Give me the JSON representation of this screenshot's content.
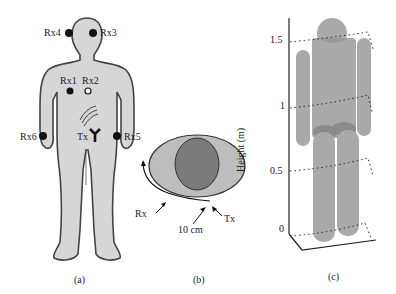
{
  "panel_a": {
    "caption": "(a)",
    "receivers": [
      {
        "label": "Rx4"
      },
      {
        "label": "Rx3"
      },
      {
        "label": "Rx1"
      },
      {
        "label": "Rx2"
      },
      {
        "label": "Rx6"
      },
      {
        "label": "Rx5"
      }
    ],
    "transmitter": {
      "label": "Tx"
    }
  },
  "panel_b": {
    "caption": "(b)",
    "rx_label": "Rx",
    "tx_label": "Tx",
    "distance_label": "10 cm"
  },
  "panel_c": {
    "caption": "(c)",
    "ylabel": "Height (m)",
    "ticks": [
      "1.5",
      "1",
      "0.5",
      "0"
    ]
  },
  "colors": {
    "body_fill": "#d6d6d6",
    "body_outline": "#444444",
    "torso_ellipse": "#bdbdbd",
    "organ": "#7a7a7a",
    "cylinder": "#a9a9a9",
    "cylinder_dark": "#8a8a8a"
  }
}
